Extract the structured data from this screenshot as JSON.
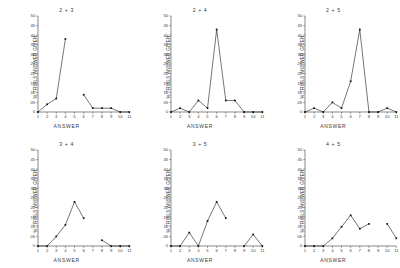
{
  "figure": {
    "xlabel": "ANSWER",
    "ylabel": "% TRIALS ANSWER GIVEN",
    "yticks": [
      "50",
      "45",
      "40",
      "35",
      "30",
      "25",
      "20",
      "15",
      "10",
      "05",
      "0"
    ],
    "xticks": [
      "1",
      "2",
      "3",
      "4",
      "5",
      "6",
      "7",
      "8",
      "9",
      "10",
      "11"
    ]
  },
  "chart_data": [
    {
      "type": "line",
      "title": "2 + 3",
      "xlabel": "ANSWER",
      "ylabel": "% TRIALS ANSWER GIVEN",
      "x": [
        1,
        2,
        3,
        4,
        5,
        6,
        7,
        8,
        9,
        10,
        11
      ],
      "values": [
        0,
        4,
        7,
        38,
        null,
        9,
        2,
        2,
        2,
        0,
        0
      ],
      "xlim": [
        1,
        11
      ],
      "ylim": [
        0,
        50
      ],
      "grid": false,
      "legend": "none"
    },
    {
      "type": "line",
      "title": "2 + 4",
      "xlabel": "ANSWER",
      "ylabel": "% TRIALS ANSWER GIVEN",
      "x": [
        1,
        2,
        3,
        4,
        5,
        6,
        7,
        8,
        9,
        10,
        11
      ],
      "values": [
        0,
        2,
        0,
        6,
        2,
        43,
        6,
        6,
        0,
        0,
        0
      ],
      "xlim": [
        1,
        11
      ],
      "ylim": [
        0,
        50
      ],
      "grid": false,
      "legend": "none"
    },
    {
      "type": "line",
      "title": "2 + 5",
      "xlabel": "ANSWER",
      "ylabel": "% TRIALS ANSWER GIVEN",
      "x": [
        1,
        2,
        3,
        4,
        5,
        6,
        7,
        8,
        9,
        10,
        11
      ],
      "values": [
        0,
        2,
        0,
        5,
        2,
        16,
        43,
        0,
        0,
        2,
        0
      ],
      "xlim": [
        1,
        11
      ],
      "ylim": [
        0,
        50
      ],
      "grid": false,
      "legend": "none"
    },
    {
      "type": "line",
      "title": "3 + 4",
      "xlabel": "ANSWER",
      "ylabel": "% TRIALS ANSWER GIVEN",
      "x": [
        1,
        2,
        3,
        4,
        5,
        6,
        7,
        8,
        9,
        10,
        11
      ],
      "values": [
        0,
        0,
        5,
        11,
        23,
        14.5,
        null,
        3,
        0,
        0,
        0
      ],
      "xlim": [
        1,
        11
      ],
      "ylim": [
        0,
        50
      ],
      "grid": false,
      "legend": "none"
    },
    {
      "type": "line",
      "title": "3 + 5",
      "xlabel": "ANSWER",
      "ylabel": "% TRIALS ANSWER GIVEN",
      "x": [
        1,
        2,
        3,
        4,
        5,
        6,
        7,
        8,
        9,
        10,
        11
      ],
      "values": [
        0,
        0,
        7,
        0,
        13,
        23,
        14.5,
        null,
        0,
        6,
        0
      ],
      "xlim": [
        1,
        11
      ],
      "ylim": [
        0,
        50
      ],
      "grid": false,
      "legend": "none"
    },
    {
      "type": "line",
      "title": "4 + 5",
      "xlabel": "ANSWER",
      "ylabel": "% TRIALS ANSWER GIVEN",
      "x": [
        1,
        2,
        3,
        4,
        5,
        6,
        7,
        8,
        9,
        10,
        11
      ],
      "values": [
        0,
        0,
        0,
        4,
        10,
        16,
        9,
        11.5,
        null,
        11.5,
        4
      ],
      "xlim": [
        1,
        11
      ],
      "ylim": [
        0,
        50
      ],
      "grid": false,
      "legend": "none"
    }
  ]
}
